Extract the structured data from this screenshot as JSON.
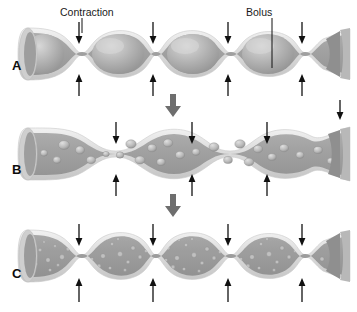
{
  "figure": {
    "background_color": "#ffffff",
    "width": 357,
    "height": 312
  },
  "colors": {
    "wall_outer": "#d9d9d9",
    "wall_highlight": "#efefef",
    "lumen_fill": "#a8a8a8",
    "lumen_shadow": "#8f8f8f",
    "bolus_fill": "#b5b5b5",
    "bolus_highlight": "#d6d6d6",
    "particle_fill": "#bdbdbd",
    "particle_dark": "#909090",
    "arrow": "#111111",
    "flow_arrow": "#6e6e6e",
    "text": "#111111"
  },
  "callouts": [
    {
      "name": "contraction",
      "label": "Contraction",
      "x": 60,
      "y": 8,
      "leader_x": 82,
      "leader_y1": 18,
      "leader_y2": 33
    },
    {
      "name": "bolus",
      "label": "Bolus",
      "x": 244,
      "y": 8,
      "leader_x": 272,
      "leader_y1": 18,
      "leader_y2": 68
    }
  ],
  "panels": [
    {
      "id": "panel-a",
      "label": "A",
      "label_x": 12,
      "label_y": 68,
      "description": "Intestinal segment with large intact boluses separated by four contraction rings",
      "bolus_count": 4,
      "contraction_count": 4,
      "content_state": "intact-boluses",
      "arrow_pairs_x": [
        79,
        153,
        228,
        302
      ],
      "arrow_down_top": 22,
      "arrow_down_bottom": 40,
      "arrow_up_top": 96,
      "arrow_up_bottom": 78
    },
    {
      "id": "panel-b",
      "label": "B",
      "label_x": 12,
      "label_y": 172,
      "description": "Boluses broken into irregular chunks by mixing; contractions shifted to new sites",
      "bolus_count": 3,
      "contraction_count": 4,
      "content_state": "coarse-chunks",
      "arrow_pairs_x": [
        116,
        192,
        267,
        340
      ],
      "arrow_down_top": 22,
      "arrow_down_bottom": 40,
      "arrow_up_top": 96,
      "arrow_up_bottom": 78
    },
    {
      "id": "panel-c",
      "label": "C",
      "label_x": 12,
      "label_y": 272,
      "description": "Contents reduced to fine particles uniformly mixed with digestive juices",
      "bolus_count": 4,
      "contraction_count": 4,
      "content_state": "fine-particles",
      "arrow_pairs_x": [
        79,
        153,
        228,
        302
      ],
      "arrow_down_top": 22,
      "arrow_down_bottom": 40,
      "arrow_up_top": 96,
      "arrow_up_bottom": 78
    }
  ],
  "flow_arrows": [
    {
      "name": "progression-arrow-a-to-b",
      "x": 170,
      "y": 96,
      "direction": "down"
    },
    {
      "name": "progression-arrow-b-to-c",
      "x": 170,
      "y": 196,
      "direction": "down"
    }
  ]
}
